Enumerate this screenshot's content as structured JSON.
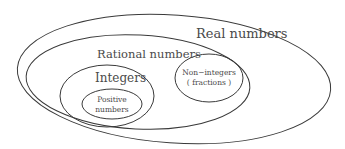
{
  "diagram": {
    "type": "nested-venn",
    "stroke_color": "#3a3a3a",
    "text_color": "#4a4a4a",
    "background": "#ffffff",
    "sets": {
      "real": {
        "label": "Real numbers"
      },
      "rational": {
        "label": "Rational numbers"
      },
      "integers": {
        "label": "Integers"
      },
      "positive": {
        "label_line1": "Positive",
        "label_line2": "numbers"
      },
      "non_integers": {
        "label_line1": "Non−integers",
        "label_line2": "( fractions )"
      }
    },
    "hierarchy": [
      {
        "set": "Real numbers",
        "contains": [
          "Rational numbers"
        ]
      },
      {
        "set": "Rational numbers",
        "contains": [
          "Integers",
          "Non−integers (fractions)"
        ]
      },
      {
        "set": "Integers",
        "contains": [
          "Positive numbers"
        ]
      }
    ]
  }
}
